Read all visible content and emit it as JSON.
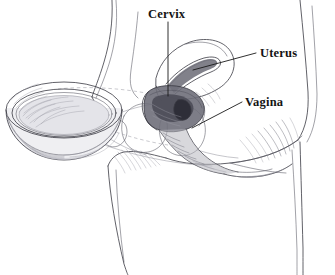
{
  "figure": {
    "type": "medical-line-illustration",
    "background_color": "#ffffff",
    "ink_color": "#3a3a42",
    "label_color": "#141414",
    "shade_color": "#6d6d78",
    "width": 335,
    "height": 275
  },
  "labels": [
    {
      "id": "cervix",
      "text": "Cervix",
      "x": 148,
      "y": 18,
      "anchor": "start",
      "leader": {
        "type": "straight",
        "points": "168,22 168,96"
      }
    },
    {
      "id": "uterus",
      "text": "Uterus",
      "x": 260,
      "y": 57,
      "anchor": "start",
      "leader": {
        "type": "straight",
        "points": "256,53 193,70"
      }
    },
    {
      "id": "vagina",
      "text": "Vagina",
      "x": 245,
      "y": 106,
      "anchor": "start",
      "leader": {
        "type": "straight",
        "points": "242,102 192,128"
      }
    }
  ],
  "parts": [
    {
      "id": "diaphragm",
      "name": "diaphragm-device",
      "description": "shallow dome-shaped contraceptive diaphragm with flexible rim, shown at left"
    },
    {
      "id": "torso",
      "name": "body-outline",
      "description": "sagittal outline of lower abdomen, buttock and thigh"
    },
    {
      "id": "uterus-body",
      "name": "uterus-body",
      "description": "pear-shaped uterus with endometrial cavity"
    },
    {
      "id": "cervix-body",
      "name": "cervix-body",
      "description": "cervix with shaded vaginal fornices, diaphragm seated over it"
    },
    {
      "id": "vaginal-canal",
      "name": "vaginal-canal",
      "description": "hatched vaginal canal angling downward and posteriorly"
    },
    {
      "id": "bladder",
      "name": "bladder-and-pubic-structures",
      "description": "rounded bladder and pubic bone silhouettes"
    },
    {
      "id": "guide",
      "name": "placement-guide-line",
      "description": "dashed line indicating the diaphragm's path to the cervix"
    }
  ]
}
